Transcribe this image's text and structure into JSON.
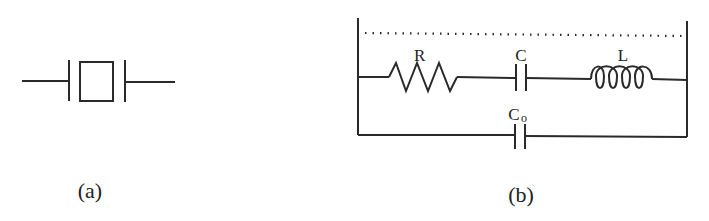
{
  "figure": {
    "panel_a": {
      "caption": "(a)",
      "symbol": "quartz-crystal-resonator"
    },
    "panel_b": {
      "caption": "(b)",
      "components": {
        "resistor": "R",
        "capacitor": "C",
        "inductor": "L",
        "shunt_capacitor_main": "C",
        "shunt_capacitor_sub": "o"
      }
    },
    "colors": {
      "line": "#2a2a2a",
      "background": "#ffffff"
    }
  }
}
